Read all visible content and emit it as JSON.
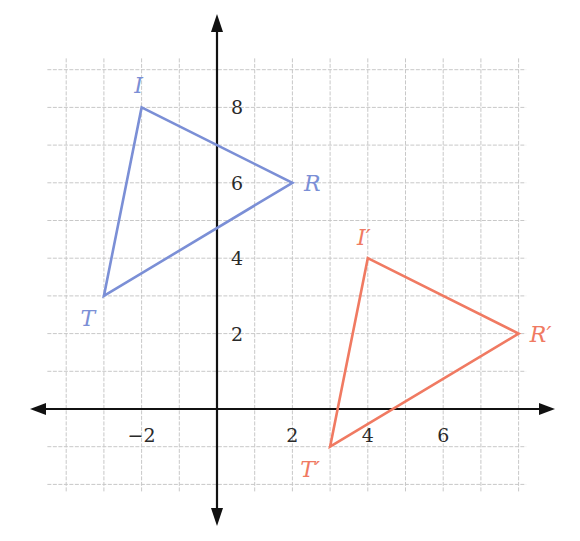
{
  "chart_data": {
    "type": "scatter",
    "title": "",
    "xlabel": "",
    "ylabel": "",
    "xlim": [
      -4.5,
      8.5
    ],
    "ylim": [
      -2.5,
      9.5
    ],
    "grid": true,
    "legend": null,
    "x_ticks": [
      {
        "value": -2,
        "label": "−2"
      },
      {
        "value": 2,
        "label": "2"
      },
      {
        "value": 4,
        "label": "4"
      },
      {
        "value": 6,
        "label": "6"
      }
    ],
    "y_ticks": [
      {
        "value": 2,
        "label": "2"
      },
      {
        "value": 4,
        "label": "4"
      },
      {
        "value": 6,
        "label": "6"
      },
      {
        "value": 8,
        "label": "8"
      }
    ],
    "series": [
      {
        "name": "Triangle TIR",
        "color": "#7b8fd6",
        "closed": true,
        "points": [
          {
            "label": "I",
            "x": -2,
            "y": 8
          },
          {
            "label": "R",
            "x": 2,
            "y": 6
          },
          {
            "label": "T",
            "x": -3,
            "y": 3
          }
        ]
      },
      {
        "name": "Triangle T'I'R'",
        "color": "#f07a62",
        "closed": true,
        "points": [
          {
            "label": "I′",
            "x": 4,
            "y": 4
          },
          {
            "label": "R′",
            "x": 8,
            "y": 2
          },
          {
            "label": "T′",
            "x": 3,
            "y": -1
          }
        ]
      }
    ]
  },
  "colors": {
    "axis": "#111111",
    "grid": "#c8c8c8",
    "triangle_original": "#7b8fd6",
    "triangle_image": "#f07a62"
  }
}
